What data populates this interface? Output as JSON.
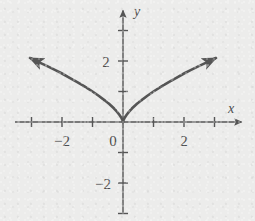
{
  "figure": {
    "background_color": "#ececeb",
    "ink_color": "#555555",
    "label_color": "#4d4d4d"
  },
  "labels": {
    "x_axis_name": "x",
    "y_axis_name": "y",
    "origin": "0",
    "x_neg2": "−2",
    "x_pos2": "2",
    "y_pos2": "2",
    "y_neg2": "−2"
  },
  "chart_data": {
    "type": "line",
    "title": "",
    "xlabel": "x",
    "ylabel": "y",
    "equation": "y = |x|^(2/3)",
    "grid": false,
    "legend": null,
    "xlim": [
      -3.2,
      3.2
    ],
    "ylim": [
      -3.2,
      3.2
    ],
    "xticks": [
      -3,
      -2,
      -1,
      1,
      2,
      3
    ],
    "yticks": [
      -3,
      -2,
      -1,
      1,
      2,
      3
    ],
    "xtick_labels": [
      "",
      "−2",
      "",
      "",
      "2",
      ""
    ],
    "ytick_labels": [
      "",
      "−2",
      "",
      "",
      "2",
      ""
    ],
    "axis_arrows": [
      "x-positive",
      "y-positive",
      "x-negative",
      "y-negative"
    ],
    "curve_arrow_ends": [
      "left",
      "right"
    ],
    "series": [
      {
        "name": "y = |x|^(2/3)",
        "x": [
          -3.05,
          -2.8,
          -2.5,
          -2.2,
          -2.0,
          -1.75,
          -1.5,
          -1.25,
          -1.0,
          -0.8,
          -0.6,
          -0.45,
          -0.3,
          -0.2,
          -0.12,
          -0.06,
          -0.02,
          0,
          0.02,
          0.06,
          0.12,
          0.2,
          0.3,
          0.45,
          0.6,
          0.8,
          1.0,
          1.25,
          1.5,
          1.75,
          2.0,
          2.2,
          2.5,
          2.8,
          3.05
        ],
        "y": [
          2.1,
          1.98,
          1.84,
          1.69,
          1.59,
          1.45,
          1.31,
          1.16,
          1.0,
          0.86,
          0.71,
          0.59,
          0.45,
          0.34,
          0.24,
          0.15,
          0.07,
          0,
          0.07,
          0.15,
          0.24,
          0.34,
          0.45,
          0.59,
          0.71,
          0.86,
          1.0,
          1.16,
          1.31,
          1.45,
          1.59,
          1.69,
          1.84,
          1.98,
          2.1
        ]
      }
    ]
  }
}
